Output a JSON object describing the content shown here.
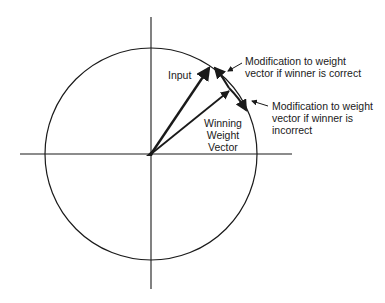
{
  "diagram": {
    "colors": {
      "stroke": "#1a1a1a",
      "background": "#ffffff"
    },
    "labels": {
      "input": "Input",
      "winning_weight": [
        "Winning",
        "Weight",
        "Vector"
      ],
      "mod_correct": [
        "Modification to weight",
        "vector if winner is correct"
      ],
      "mod_incorrect": [
        "Modification to weight",
        "vector if winner is",
        "incorrect"
      ]
    },
    "elements": {
      "circle": {
        "cx": 151,
        "cy": 154,
        "r": 106
      },
      "x_axis": {
        "x1": 20,
        "x2": 292,
        "y": 154
      },
      "y_axis": {
        "x": 151,
        "y1": 17,
        "y2": 289
      },
      "input_vector": {
        "from": [
          151,
          154
        ],
        "to": [
          211,
          65
        ]
      },
      "winning_vector": {
        "from": [
          151,
          154
        ],
        "to": [
          231,
          89
        ]
      }
    }
  }
}
